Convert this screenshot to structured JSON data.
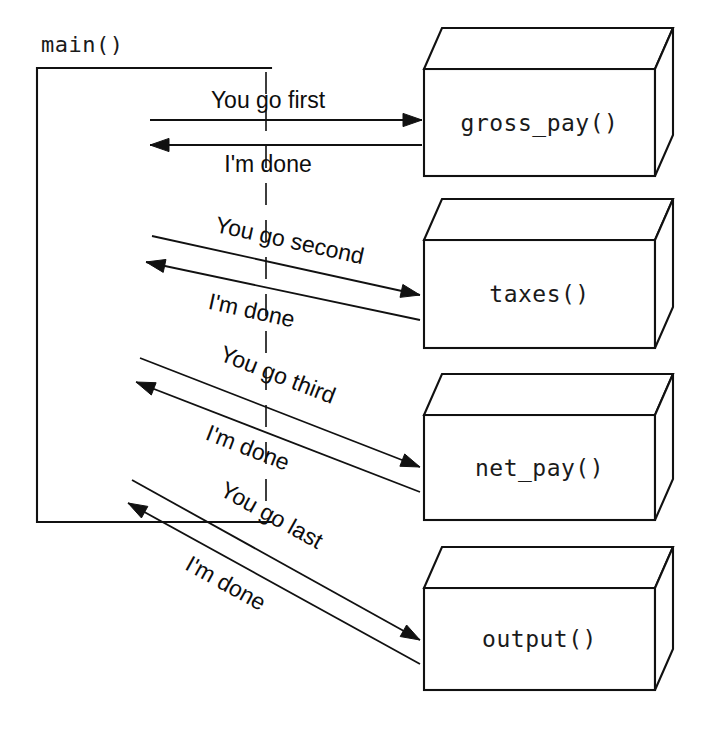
{
  "diagram": {
    "caller": {
      "label": "main()",
      "bracket": {
        "left": 37,
        "top": 68,
        "right": 271,
        "bottom": 522
      }
    },
    "colors": {
      "ink": "#111111",
      "paper": "#ffffff",
      "dashed_line": "#2a2a2a"
    },
    "lifeline": {
      "name": "dashed-lifeline",
      "x": 266,
      "top": 72,
      "bottom": 510
    },
    "boxes": [
      {
        "label": "gross_pay()",
        "name": "box-gross-pay",
        "front": {
          "x": 424,
          "y": 69,
          "w": 231,
          "h": 107
        },
        "depth_x": 18,
        "depth_y": 41
      },
      {
        "label": "taxes()",
        "name": "box-taxes",
        "front": {
          "x": 424,
          "y": 240,
          "w": 231,
          "h": 108
        },
        "depth_x": 18,
        "depth_y": 41
      },
      {
        "label": "net_pay()",
        "name": "box-net-pay",
        "front": {
          "x": 424,
          "y": 415,
          "w": 231,
          "h": 105
        },
        "depth_x": 18,
        "depth_y": 41
      },
      {
        "label": "output()",
        "name": "box-output",
        "front": {
          "x": 424,
          "y": 588,
          "w": 231,
          "h": 102
        },
        "depth_x": 18,
        "depth_y": 41
      }
    ],
    "messages": [
      {
        "name": "message-you-go-first",
        "label": "You go first",
        "direction": "caller-to-callee",
        "from": {
          "x": 150,
          "y": 120
        },
        "to": {
          "x": 422,
          "y": 120
        },
        "label_pos": {
          "x": 268,
          "y": 108
        },
        "label_anchor": "middle",
        "rotation": 0
      },
      {
        "name": "message-im-done-1",
        "label": "I'm done",
        "direction": "callee-to-caller",
        "from": {
          "x": 422,
          "y": 145
        },
        "to": {
          "x": 150,
          "y": 145
        },
        "label_pos": {
          "x": 268,
          "y": 172
        },
        "label_anchor": "middle",
        "rotation": 0
      },
      {
        "name": "message-you-go-second",
        "label": "You go second",
        "direction": "caller-to-callee",
        "from": {
          "x": 152,
          "y": 236
        },
        "to": {
          "x": 420,
          "y": 295
        },
        "label_pos": {
          "x": 288,
          "y": 248
        },
        "label_anchor": "middle",
        "rotation": 12.4
      },
      {
        "name": "message-im-done-2",
        "label": "I'm done",
        "direction": "callee-to-caller",
        "from": {
          "x": 420,
          "y": 320
        },
        "to": {
          "x": 146,
          "y": 262
        },
        "label_pos": {
          "x": 250,
          "y": 318
        },
        "label_anchor": "middle",
        "rotation": 12.4
      },
      {
        "name": "message-you-go-third",
        "label": "You go third",
        "direction": "caller-to-callee",
        "from": {
          "x": 140,
          "y": 358
        },
        "to": {
          "x": 420,
          "y": 467
        },
        "label_pos": {
          "x": 275,
          "y": 382
        },
        "label_anchor": "middle",
        "rotation": 21.3
      },
      {
        "name": "message-im-done-3",
        "label": "I'm done",
        "direction": "callee-to-caller",
        "from": {
          "x": 420,
          "y": 492
        },
        "to": {
          "x": 136,
          "y": 382
        },
        "label_pos": {
          "x": 245,
          "y": 455
        },
        "label_anchor": "middle",
        "rotation": 21.3
      },
      {
        "name": "message-you-go-last",
        "label": "You go last",
        "direction": "caller-to-callee",
        "from": {
          "x": 132,
          "y": 480
        },
        "to": {
          "x": 420,
          "y": 640
        },
        "label_pos": {
          "x": 268,
          "y": 522
        },
        "label_anchor": "middle",
        "rotation": 29
      },
      {
        "name": "message-im-done-4",
        "label": "I'm done",
        "direction": "callee-to-caller",
        "from": {
          "x": 420,
          "y": 664
        },
        "to": {
          "x": 128,
          "y": 503
        },
        "label_pos": {
          "x": 222,
          "y": 590
        },
        "label_anchor": "middle",
        "rotation": 29
      }
    ]
  }
}
